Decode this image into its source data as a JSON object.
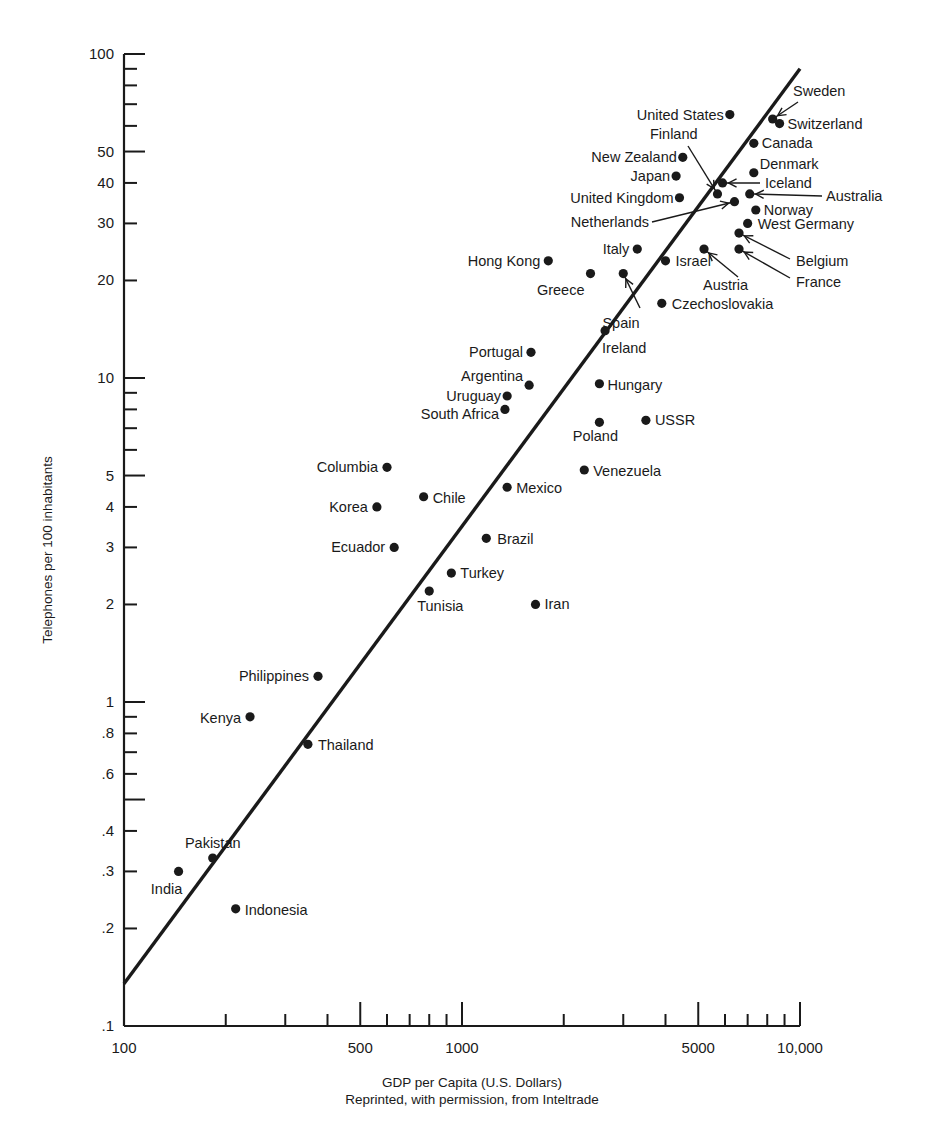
{
  "chart_data": {
    "type": "scatter",
    "title": "",
    "xlabel": "GDP per Capita (U.S. Dollars)",
    "ylabel": "Telephones per 100 inhabitants",
    "source_note": "Reprinted, with permission, from Inteltrade",
    "xscale": "log",
    "yscale": "log",
    "xlim": [
      100,
      10000
    ],
    "ylim": [
      0.1,
      100
    ],
    "grid": false,
    "x_tick_labels": [
      {
        "value": 100,
        "label": "100"
      },
      {
        "value": 500,
        "label": "500"
      },
      {
        "value": 1000,
        "label": "1000"
      },
      {
        "value": 5000,
        "label": "5000"
      },
      {
        "value": 10000,
        "label": "10,000"
      }
    ],
    "x_minor_ticks": [
      200,
      300,
      400,
      600,
      700,
      800,
      900,
      2000,
      3000,
      4000,
      6000,
      7000,
      8000,
      9000
    ],
    "y_tick_labels": [
      {
        "value": 100,
        "label": "100"
      },
      {
        "value": 50,
        "label": "50"
      },
      {
        "value": 40,
        "label": "40"
      },
      {
        "value": 30,
        "label": "30"
      },
      {
        "value": 20,
        "label": "20"
      },
      {
        "value": 10,
        "label": "10"
      },
      {
        "value": 5,
        "label": "5"
      },
      {
        "value": 4,
        "label": "4"
      },
      {
        "value": 3,
        "label": "3"
      },
      {
        "value": 2,
        "label": "2"
      },
      {
        "value": 1,
        "label": "1"
      },
      {
        "value": 0.8,
        "label": ".8"
      },
      {
        "value": 0.6,
        "label": ".6"
      },
      {
        "value": 0.4,
        "label": ".4"
      },
      {
        "value": 0.3,
        "label": ".3"
      },
      {
        "value": 0.2,
        "label": ".2"
      },
      {
        "value": 0.1,
        "label": ".1"
      }
    ],
    "y_unlabeled_ticks": [
      90,
      80,
      70,
      60,
      9,
      8,
      7,
      6,
      0.9,
      0.7,
      0.5
    ],
    "fit_line": {
      "x": [
        100,
        10000
      ],
      "y": [
        0.135,
        90
      ]
    },
    "points": [
      {
        "name": "United States",
        "x": 6200,
        "y": 65,
        "lx": -6,
        "ly": 5,
        "anchor": "end"
      },
      {
        "name": "Sweden",
        "x": 8300,
        "y": 63,
        "lx": 793,
        "ly": 96,
        "anchor": "start",
        "arrow": [
          798,
          102
        ]
      },
      {
        "name": "Switzerland",
        "x": 8700,
        "y": 61,
        "lx": 8,
        "ly": 5,
        "anchor": "start"
      },
      {
        "name": "Canada",
        "x": 7300,
        "y": 53,
        "lx": 8,
        "ly": 5,
        "anchor": "start"
      },
      {
        "name": "New Zealand",
        "x": 4500,
        "y": 48,
        "lx": -6,
        "ly": 5,
        "anchor": "end"
      },
      {
        "name": "Denmark",
        "x": 7300,
        "y": 43,
        "lx": 6,
        "ly": -4,
        "anchor": "start"
      },
      {
        "name": "Japan",
        "x": 4300,
        "y": 42,
        "lx": -6,
        "ly": 5,
        "anchor": "end"
      },
      {
        "name": "Iceland",
        "x": 5900,
        "y": 40,
        "lx": 765,
        "ly": 188,
        "anchor": "start",
        "arrow": [
          760,
          183
        ]
      },
      {
        "name": "Finland",
        "x": 5700,
        "y": 37,
        "lx": 650,
        "ly": 139,
        "anchor": "start",
        "arrow": [
          688,
          146
        ]
      },
      {
        "name": "Australia",
        "x": 7100,
        "y": 37,
        "lx": 826,
        "ly": 201,
        "anchor": "start",
        "arrow": [
          822,
          196
        ]
      },
      {
        "name": "United Kingdom",
        "x": 4400,
        "y": 36,
        "lx": -6,
        "ly": 5,
        "anchor": "end"
      },
      {
        "name": "Netherlands",
        "x": 6400,
        "y": 35,
        "lx": 649,
        "ly": 227,
        "anchor": "end",
        "arrow": [
          652,
          222
        ]
      },
      {
        "name": "Norway",
        "x": 7400,
        "y": 33,
        "lx": 8,
        "ly": 5,
        "anchor": "start"
      },
      {
        "name": "West Germany",
        "x": 7000,
        "y": 30,
        "lx": 10,
        "ly": 6,
        "anchor": "start"
      },
      {
        "name": "Belgium",
        "x": 6600,
        "y": 28,
        "lx": 796,
        "ly": 266,
        "anchor": "start",
        "arrow": [
          790,
          259
        ]
      },
      {
        "name": "Italy",
        "x": 3300,
        "y": 25,
        "lx": -8,
        "ly": 5,
        "anchor": "end"
      },
      {
        "name": "Austria",
        "x": 5200,
        "y": 25,
        "lx": 703,
        "ly": 290,
        "anchor": "start",
        "arrow": [
          738,
          277
        ]
      },
      {
        "name": "France",
        "x": 6600,
        "y": 25,
        "lx": 796,
        "ly": 287,
        "anchor": "start",
        "arrow": [
          790,
          278
        ]
      },
      {
        "name": "Hong Kong",
        "x": 1800,
        "y": 23,
        "lx": -8,
        "ly": 5,
        "anchor": "end"
      },
      {
        "name": "Israel",
        "x": 4000,
        "y": 23,
        "lx": 10,
        "ly": 5,
        "anchor": "start"
      },
      {
        "name": "Greece",
        "x": 2400,
        "y": 21,
        "lx": -6,
        "ly": 21,
        "anchor": "end"
      },
      {
        "name": "Spain",
        "x": 3000,
        "y": 21,
        "lx": 621,
        "ly": 328,
        "anchor": "middle",
        "arrow": [
          640,
          308
        ]
      },
      {
        "name": "Czechoslovakia",
        "x": 3900,
        "y": 17,
        "lx": 10,
        "ly": 6,
        "anchor": "start"
      },
      {
        "name": "Ireland",
        "x": 2650,
        "y": 14,
        "lx": -3,
        "ly": 22,
        "anchor": "start"
      },
      {
        "name": "Portugal",
        "x": 1600,
        "y": 12,
        "lx": -8,
        "ly": 5,
        "anchor": "end"
      },
      {
        "name": "Hungary",
        "x": 2550,
        "y": 9.6,
        "lx": 8,
        "ly": 6,
        "anchor": "start"
      },
      {
        "name": "Argentina",
        "x": 1580,
        "y": 9.5,
        "lx": -6,
        "ly": -4,
        "anchor": "end"
      },
      {
        "name": "Uruguay",
        "x": 1360,
        "y": 8.8,
        "lx": -6,
        "ly": 5,
        "anchor": "end"
      },
      {
        "name": "South Africa",
        "x": 1340,
        "y": 8.0,
        "lx": -6,
        "ly": 10,
        "anchor": "end"
      },
      {
        "name": "Poland",
        "x": 2550,
        "y": 7.3,
        "lx": -4,
        "ly": 19,
        "anchor": "middle"
      },
      {
        "name": "USSR",
        "x": 3500,
        "y": 7.4,
        "lx": 9,
        "ly": 5,
        "anchor": "start"
      },
      {
        "name": "Columbia",
        "x": 600,
        "y": 5.3,
        "lx": -9,
        "ly": 5,
        "anchor": "end"
      },
      {
        "name": "Venezuela",
        "x": 2300,
        "y": 5.2,
        "lx": 9,
        "ly": 6,
        "anchor": "start"
      },
      {
        "name": "Mexico",
        "x": 1360,
        "y": 4.6,
        "lx": 9,
        "ly": 6,
        "anchor": "start"
      },
      {
        "name": "Chile",
        "x": 770,
        "y": 4.3,
        "lx": 9,
        "ly": 6,
        "anchor": "start"
      },
      {
        "name": "Korea",
        "x": 560,
        "y": 4.0,
        "lx": -9,
        "ly": 5,
        "anchor": "end"
      },
      {
        "name": "Brazil",
        "x": 1180,
        "y": 3.2,
        "lx": 11,
        "ly": 6,
        "anchor": "start"
      },
      {
        "name": "Ecuador",
        "x": 630,
        "y": 3.0,
        "lx": -9,
        "ly": 5,
        "anchor": "end"
      },
      {
        "name": "Turkey",
        "x": 930,
        "y": 2.5,
        "lx": 9,
        "ly": 5,
        "anchor": "start"
      },
      {
        "name": "Tunisia",
        "x": 800,
        "y": 2.2,
        "lx": -12,
        "ly": 20,
        "anchor": "start"
      },
      {
        "name": "Iran",
        "x": 1650,
        "y": 2.0,
        "lx": 9,
        "ly": 5,
        "anchor": "start"
      },
      {
        "name": "Philippines",
        "x": 375,
        "y": 1.2,
        "lx": -9,
        "ly": 5,
        "anchor": "end"
      },
      {
        "name": "Kenya",
        "x": 236,
        "y": 0.9,
        "lx": -9,
        "ly": 6,
        "anchor": "end"
      },
      {
        "name": "Thailand",
        "x": 350,
        "y": 0.74,
        "lx": 10,
        "ly": 6,
        "anchor": "start"
      },
      {
        "name": "Pakistan",
        "x": 183,
        "y": 0.33,
        "lx": 0,
        "ly": -10,
        "anchor": "middle"
      },
      {
        "name": "India",
        "x": 145,
        "y": 0.3,
        "lx": -12,
        "ly": 23,
        "anchor": "middle"
      },
      {
        "name": "Indonesia",
        "x": 214,
        "y": 0.23,
        "lx": 9,
        "ly": 6,
        "anchor": "start"
      }
    ]
  },
  "figure": {
    "ylabel": "Telephones per 100 inhabitants",
    "xlabel": "GDP per Capita (U.S. Dollars)",
    "source_note": "Reprinted, with permission, from Inteltrade"
  }
}
